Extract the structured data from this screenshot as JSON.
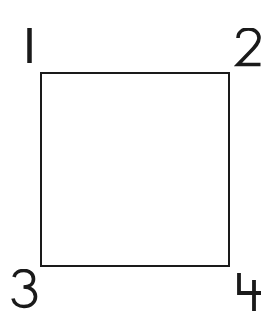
{
  "diagram": {
    "shape": "square",
    "stroke_color": "#1a1a1a",
    "fill_color": "#ffffff",
    "corners": [
      {
        "id": "top-left",
        "label": "1"
      },
      {
        "id": "top-right",
        "label": "2"
      },
      {
        "id": "bottom-left",
        "label": "3"
      },
      {
        "id": "bottom-right",
        "label": "4"
      }
    ]
  }
}
